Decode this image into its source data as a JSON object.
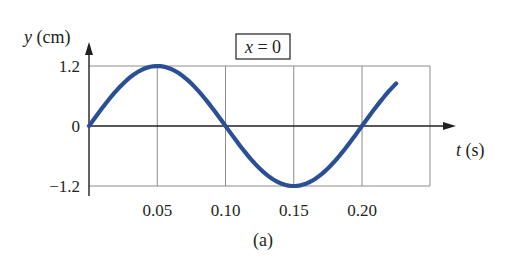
{
  "chart_data": {
    "type": "line",
    "title": "",
    "annotation": "x = 0",
    "annotation_var": "x",
    "annotation_rest": " = 0",
    "caption": "(a)",
    "xlabel": "t (s)",
    "xlabel_var": "t",
    "xlabel_unit": " (s)",
    "ylabel": "y (cm)",
    "ylabel_var": "y",
    "ylabel_unit": " (cm)",
    "xlim": [
      0,
      0.25
    ],
    "ylim": [
      -1.2,
      1.2
    ],
    "xticks": [
      0.05,
      0.1,
      0.15,
      0.2
    ],
    "xtick_labels": [
      "0.05",
      "0.10",
      "0.15",
      "0.20"
    ],
    "yticks": [
      1.2,
      0,
      -1.2
    ],
    "ytick_labels": [
      "1.2",
      "0",
      "−1.2"
    ],
    "grid": true,
    "series": [
      {
        "name": "y(t) at x = 0",
        "function": "1.2 sin(2π t / 0.20)",
        "amplitude": 1.2,
        "period": 0.2,
        "t_start": 0,
        "t_end": 0.225,
        "color": "#2b4f95",
        "points": [
          {
            "t": 0,
            "y": 0
          },
          {
            "t": 0.05,
            "y": 1.2
          },
          {
            "t": 0.1,
            "y": 0
          },
          {
            "t": 0.15,
            "y": -1.2
          },
          {
            "t": 0.2,
            "y": 0
          },
          {
            "t": 0.225,
            "y": 0.85
          }
        ]
      }
    ]
  },
  "colors": {
    "curve": "#2b4f95",
    "axis": "#231f20",
    "grid": "#8c8c8c",
    "text": "#231f20"
  }
}
